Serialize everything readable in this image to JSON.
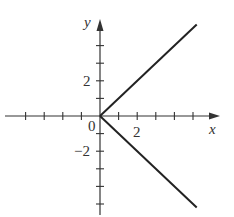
{
  "chart_data": {
    "type": "line",
    "title": "",
    "xlabel": "x",
    "ylabel": "y",
    "origin_label": "0",
    "x_tick_labels": [
      {
        "value": 2,
        "label": "2"
      }
    ],
    "y_tick_labels": [
      {
        "value": 2,
        "label": "2"
      },
      {
        "value": -2,
        "label": "−2"
      }
    ],
    "x_ticks": [
      -4,
      -3,
      -2,
      -1,
      1,
      2,
      3,
      4,
      5
    ],
    "y_ticks": [
      -5,
      -4,
      -3,
      -2,
      -1,
      1,
      2,
      3,
      4
    ],
    "xlim": [
      -5,
      6
    ],
    "ylim": [
      -5.5,
      5.5
    ],
    "grid": false,
    "series": [
      {
        "name": "upper branch",
        "x": [
          0,
          5.2
        ],
        "y": [
          0,
          5.2
        ],
        "color": "#222222"
      },
      {
        "name": "lower branch",
        "x": [
          0,
          5.2
        ],
        "y": [
          0,
          -5.2
        ],
        "color": "#222222"
      }
    ]
  }
}
